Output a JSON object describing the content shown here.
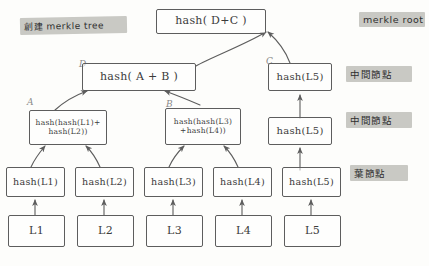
{
  "diagram": {
    "title_note": "創建 merkle tree",
    "side_notes": [
      {
        "text": "merkle root"
      },
      {
        "text": "中間節點"
      },
      {
        "text": "中間節點"
      },
      {
        "text": "葉節點"
      }
    ],
    "corner_labels": [
      {
        "text": "D"
      },
      {
        "text": "A"
      },
      {
        "text": "B"
      },
      {
        "text": "C"
      }
    ],
    "root": {
      "text": "hash( D+C )"
    },
    "level_ab": {
      "text": "hash( A + B )"
    },
    "node_a": {
      "line1": "hash(hash(L1)+",
      "line2": "hash(L2))"
    },
    "node_b": {
      "line1": "hash(hash(L3)",
      "line2": "+hash(L4))"
    },
    "node_c_top": {
      "text": "hash(L5)"
    },
    "node_c_mid": {
      "text": "hash(L5)"
    },
    "hash_leaves": [
      {
        "text": "hash(L1)"
      },
      {
        "text": "hash(L2)"
      },
      {
        "text": "hash(L3)"
      },
      {
        "text": "hash(L4)"
      },
      {
        "text": "hash(L5)"
      }
    ],
    "data_blocks": [
      {
        "text": "L1"
      },
      {
        "text": "L2"
      },
      {
        "text": "L3"
      },
      {
        "text": "L4"
      },
      {
        "text": "L5"
      }
    ],
    "colors": {
      "ink": "#5d5d5d",
      "highlight": "#c9c9c4",
      "paper": "#fdfdfb"
    }
  }
}
